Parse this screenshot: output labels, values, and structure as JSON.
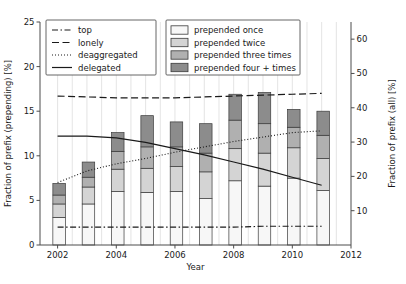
{
  "chart_data": {
    "type": "bar",
    "title": "",
    "xlabel": "Year",
    "ylabel": "Fraction of prefix (prepending) [%]",
    "y2label": "Fraction of prefix (all) [%]",
    "xlim": [
      2001.4,
      2012.0
    ],
    "ylim": [
      0,
      25
    ],
    "y2lim": [
      0,
      65
    ],
    "xticks": [
      2002,
      2004,
      2006,
      2008,
      2010,
      2012
    ],
    "yticks": [
      0,
      5,
      10,
      15,
      20,
      25
    ],
    "y2ticks": [
      10,
      20,
      30,
      40,
      50,
      60
    ],
    "grid": "vertical-minor",
    "legend_position": "upper-left-and-upper-center",
    "categories": [
      2002,
      2003,
      2004,
      2005,
      2006,
      2007,
      2008,
      2009,
      2010,
      2011
    ],
    "series": [
      {
        "name": "prepended once",
        "color": "#f7f7f7",
        "values": [
          3.1,
          4.6,
          6.0,
          5.9,
          6.0,
          5.2,
          7.2,
          6.6,
          7.5,
          6.1
        ]
      },
      {
        "name": "prepended twice",
        "color": "#d4d4d4",
        "values": [
          1.5,
          1.9,
          2.5,
          2.7,
          2.8,
          3.0,
          3.6,
          3.7,
          3.4,
          3.6
        ]
      },
      {
        "name": "prepended three times",
        "color": "#b0b0b0",
        "values": [
          1.0,
          1.1,
          2.0,
          2.4,
          2.2,
          2.1,
          3.2,
          3.3,
          2.3,
          2.6
        ]
      },
      {
        "name": "prepended four + times",
        "color": "#8c8c8c",
        "values": [
          1.3,
          1.7,
          2.1,
          3.5,
          2.8,
          3.3,
          2.9,
          3.5,
          2.0,
          2.7
        ]
      }
    ],
    "lines": [
      {
        "name": "top",
        "style": "dashdot",
        "x": [
          2002,
          2003,
          2004,
          2005,
          2006,
          2007,
          2008,
          2009,
          2010,
          2011
        ],
        "y": [
          2.0,
          2.0,
          2.0,
          2.0,
          2.0,
          2.0,
          2.0,
          2.1,
          2.1,
          2.1
        ]
      },
      {
        "name": "lonely",
        "style": "dashed",
        "x": [
          2002,
          2003,
          2004,
          2005,
          2006,
          2007,
          2008,
          2009,
          2010,
          2011
        ],
        "y": [
          16.7,
          16.6,
          16.5,
          16.5,
          16.5,
          16.6,
          16.7,
          16.8,
          16.9,
          17.0
        ]
      },
      {
        "name": "deaggregated",
        "style": "dotted",
        "x": [
          2002,
          2003,
          2004,
          2005,
          2006,
          2007,
          2008,
          2009,
          2010,
          2011
        ],
        "y": [
          7.0,
          8.3,
          9.1,
          9.7,
          10.4,
          11.0,
          11.6,
          12.1,
          12.6,
          12.8
        ]
      },
      {
        "name": "delegated",
        "style": "solid",
        "x": [
          2002,
          2003,
          2004,
          2005,
          2006,
          2007,
          2008,
          2009,
          2010,
          2011
        ],
        "y": [
          12.2,
          12.2,
          12.0,
          11.5,
          10.8,
          10.1,
          9.3,
          8.5,
          7.6,
          6.7
        ]
      }
    ]
  },
  "axes": {
    "xlabel": "Year",
    "ylabel": "Fraction of prefix (prepending) [%]",
    "y2label": "Fraction of prefix (all) [%]",
    "xticks": [
      "2002",
      "2004",
      "2006",
      "2008",
      "2010",
      "2012"
    ],
    "yticks": [
      "0",
      "5",
      "10",
      "15",
      "20",
      "25"
    ],
    "y2ticks": [
      "10",
      "20",
      "30",
      "40",
      "50",
      "60"
    ]
  },
  "legend_lines": {
    "items": [
      {
        "label": "top"
      },
      {
        "label": "lonely"
      },
      {
        "label": "deaggregated"
      },
      {
        "label": "delegated"
      }
    ]
  },
  "legend_bars": {
    "items": [
      {
        "label": "prepended once"
      },
      {
        "label": "prepended twice"
      },
      {
        "label": "prepended three times"
      },
      {
        "label": "prepended four + times"
      }
    ]
  }
}
